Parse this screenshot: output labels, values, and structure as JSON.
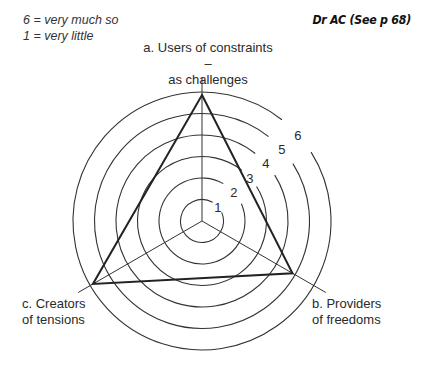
{
  "legend": {
    "high": "6 = very much so",
    "low": "1 = very little"
  },
  "reference": "Dr AC (See p 68)",
  "axes": {
    "a": {
      "line1": "a. Users of constraints –",
      "line2": "as challenges"
    },
    "b": {
      "line1": "b. Providers",
      "line2": "of freedoms"
    },
    "c": {
      "line1": "c. Creators",
      "line2": "of tensions"
    }
  },
  "caption": "Figure (cut off at bottom edge)",
  "chart_data": {
    "type": "radar",
    "title": "",
    "scale": {
      "min": 1,
      "max": 6,
      "ticks": [
        1,
        2,
        3,
        4,
        5,
        6
      ],
      "tick_labels": [
        "1",
        "2",
        "3",
        "4",
        "5",
        "6"
      ]
    },
    "scale_legend": {
      "6": "very much so",
      "1": "very little"
    },
    "categories": [
      "a. Users of constraints – as challenges",
      "b. Providers of freedoms",
      "c. Creators of tensions"
    ],
    "series": [
      {
        "name": "Dr AC",
        "values": [
          6,
          5,
          6
        ]
      }
    ],
    "grid": "concentric circles",
    "annotation": "Dr AC (See p 68)"
  }
}
